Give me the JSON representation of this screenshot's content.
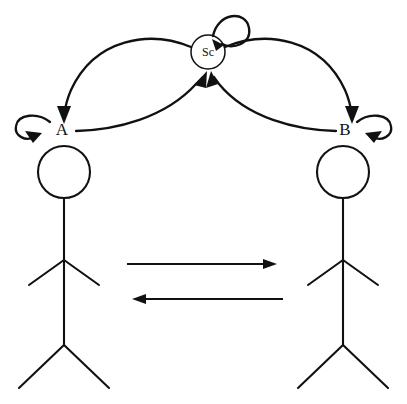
{
  "diagram": {
    "background_color": "#ffffff",
    "stroke_color": "#111111",
    "nodes": [
      {
        "id": "agent-a",
        "label": "A",
        "kind": "agent",
        "x": 62,
        "y": 130,
        "has_self_loop": true,
        "self_loop_side": "left"
      },
      {
        "id": "agent-b",
        "label": "B",
        "kind": "agent",
        "x": 345,
        "y": 130,
        "has_self_loop": true,
        "self_loop_side": "right"
      },
      {
        "id": "shared-context",
        "label": "Sc",
        "kind": "shared",
        "x": 208,
        "y": 52,
        "radius": 17,
        "has_self_loop": true,
        "self_loop_side": "top"
      }
    ],
    "figures": [
      {
        "id": "figure-left",
        "for_node": "agent-a",
        "head_center_x": 64,
        "head_center_y": 172,
        "head_radius": 26
      },
      {
        "id": "figure-right",
        "for_node": "agent-b",
        "head_center_x": 343,
        "head_center_y": 172,
        "head_radius": 26
      }
    ],
    "edges": [
      {
        "id": "edge-sc-to-a",
        "from": "shared-context",
        "to": "agent-a",
        "style": "curved-outer",
        "direction": "sc->a"
      },
      {
        "id": "edge-a-to-sc",
        "from": "agent-a",
        "to": "shared-context",
        "style": "curved-inner",
        "direction": "a->sc"
      },
      {
        "id": "edge-sc-to-b",
        "from": "shared-context",
        "to": "agent-b",
        "style": "curved-outer",
        "direction": "sc->b"
      },
      {
        "id": "edge-b-to-sc",
        "from": "agent-b",
        "to": "shared-context",
        "style": "curved-inner",
        "direction": "b->sc"
      },
      {
        "id": "message-arrow-rightward",
        "from": "figure-left",
        "to": "figure-right",
        "style": "straight",
        "direction": "left-to-right",
        "y": 264,
        "x_start": 127,
        "x_end": 276
      },
      {
        "id": "message-arrow-leftward",
        "from": "figure-right",
        "to": "figure-left",
        "style": "straight",
        "direction": "right-to-left",
        "y": 299,
        "x_start": 283,
        "x_end": 133
      }
    ]
  }
}
